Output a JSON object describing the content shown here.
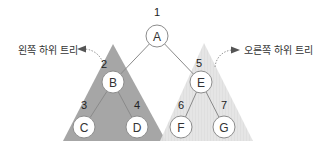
{
  "diagram": {
    "type": "binary-tree-preorder",
    "nodes": [
      {
        "id": "A",
        "label": "A",
        "order": "1"
      },
      {
        "id": "B",
        "label": "B",
        "order": "2"
      },
      {
        "id": "C",
        "label": "C",
        "order": "3"
      },
      {
        "id": "D",
        "label": "D",
        "order": "4"
      },
      {
        "id": "E",
        "label": "E",
        "order": "5"
      },
      {
        "id": "F",
        "label": "F",
        "order": "6"
      },
      {
        "id": "G",
        "label": "G",
        "order": "7"
      }
    ],
    "edges": [
      {
        "from": "A",
        "to": "B"
      },
      {
        "from": "A",
        "to": "E"
      },
      {
        "from": "B",
        "to": "C"
      },
      {
        "from": "B",
        "to": "D"
      },
      {
        "from": "E",
        "to": "F"
      },
      {
        "from": "E",
        "to": "G"
      }
    ],
    "subtrees": {
      "left": {
        "caption": "왼쪽 하위 트리",
        "color": "#a6a6a6"
      },
      "right": {
        "caption": "오른쪽 하위 트리",
        "color": "#e2e2e2"
      }
    }
  }
}
